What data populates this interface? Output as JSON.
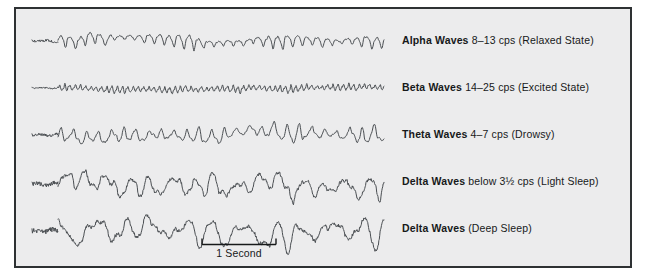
{
  "figure": {
    "background_color": "#ececed",
    "border_color": "#2e3133",
    "trace_color": "#4a4e52",
    "text_color": "#17191a"
  },
  "traces": [
    {
      "id": "alpha",
      "name": "Alpha Waves",
      "description": "8–13 cps (Relaxed State)",
      "frequency_cps": [
        8,
        13
      ],
      "state": "Relaxed State",
      "baseline_y": 32,
      "amplitude": 11,
      "cycles": 33,
      "jitter": 0.1,
      "envelope": "spindle",
      "roughness": 0.06
    },
    {
      "id": "beta",
      "name": "Beta Waves",
      "description": "14–25 cps (Excited State)",
      "frequency_cps": [
        14,
        25
      ],
      "state": "Excited State",
      "baseline_y": 79,
      "amplitude": 6,
      "cycles": 62,
      "jitter": 0.22,
      "envelope": "flat",
      "roughness": 0.45
    },
    {
      "id": "theta",
      "name": "Theta Waves",
      "description": "4–7 cps (Drowsy)",
      "frequency_cps": [
        4,
        7
      ],
      "state": "Drowsy",
      "baseline_y": 126,
      "amplitude": 12,
      "cycles": 26,
      "jitter": 0.28,
      "envelope": "wander",
      "roughness": 0.18
    },
    {
      "id": "delta-light",
      "name": "Delta Waves",
      "description": "below 3½ cps (Light Sleep)",
      "frequency_cps": [
        0,
        3.5
      ],
      "state": "Light Sleep",
      "baseline_y": 175,
      "amplitude": 19,
      "cycles": 15,
      "jitter": 0.48,
      "envelope": "wander",
      "roughness": 0.34
    },
    {
      "id": "delta-deep",
      "name": "Delta Waves",
      "description": "(Deep Sleep)",
      "frequency_cps": [
        0,
        3.5
      ],
      "state": "Deep Sleep",
      "baseline_y": 222,
      "amplitude": 23,
      "cycles": 11,
      "jitter": 0.55,
      "envelope": "wander",
      "roughness": 0.3
    }
  ],
  "legend_rows": [
    {
      "top": 25,
      "name": "Alpha Waves",
      "desc": " 8–13 cps (Relaxed State)"
    },
    {
      "top": 72,
      "name": "Beta Waves",
      "desc": " 14–25 cps (Excited State)"
    },
    {
      "top": 119,
      "name": "Theta Waves",
      "desc": " 4–7 cps (Drowsy)"
    },
    {
      "top": 166,
      "name": "Delta Waves",
      "desc": " below 3½ cps (Light Sleep)"
    },
    {
      "top": 213,
      "name": "Delta Waves",
      "desc": " (Deep Sleep)"
    }
  ],
  "scalebar": {
    "label": "1 Second",
    "span_px": 74
  },
  "trace_geometry": {
    "x_start": 42,
    "x_end": 368
  }
}
